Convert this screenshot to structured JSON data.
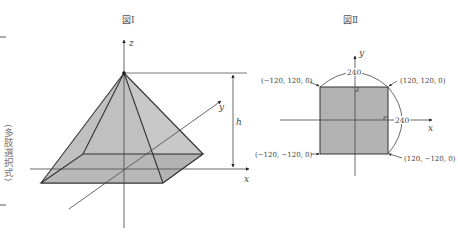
{
  "margin": {
    "side_label": "(多肢選択式)"
  },
  "figure1": {
    "title": "図Ⅰ",
    "axes": {
      "x": "x",
      "y": "y",
      "z": "z"
    },
    "height_label": "h",
    "colors": {
      "face": "#c4c4c4",
      "base": "#b5b5b5",
      "edge": "#333333"
    }
  },
  "figure2": {
    "title": "図Ⅱ",
    "axes": {
      "x": "x",
      "y": "y"
    },
    "side_top": "240",
    "side_right": "240",
    "corners": {
      "top_left": "(−120, 120, 0)",
      "top_right": "(120, 120, 0)",
      "bottom_left": "(−120, −120, 0)",
      "bottom_right": "(120, −120, 0)"
    },
    "colors": {
      "fill": "#b3b3b3",
      "edge": "#333333"
    }
  }
}
